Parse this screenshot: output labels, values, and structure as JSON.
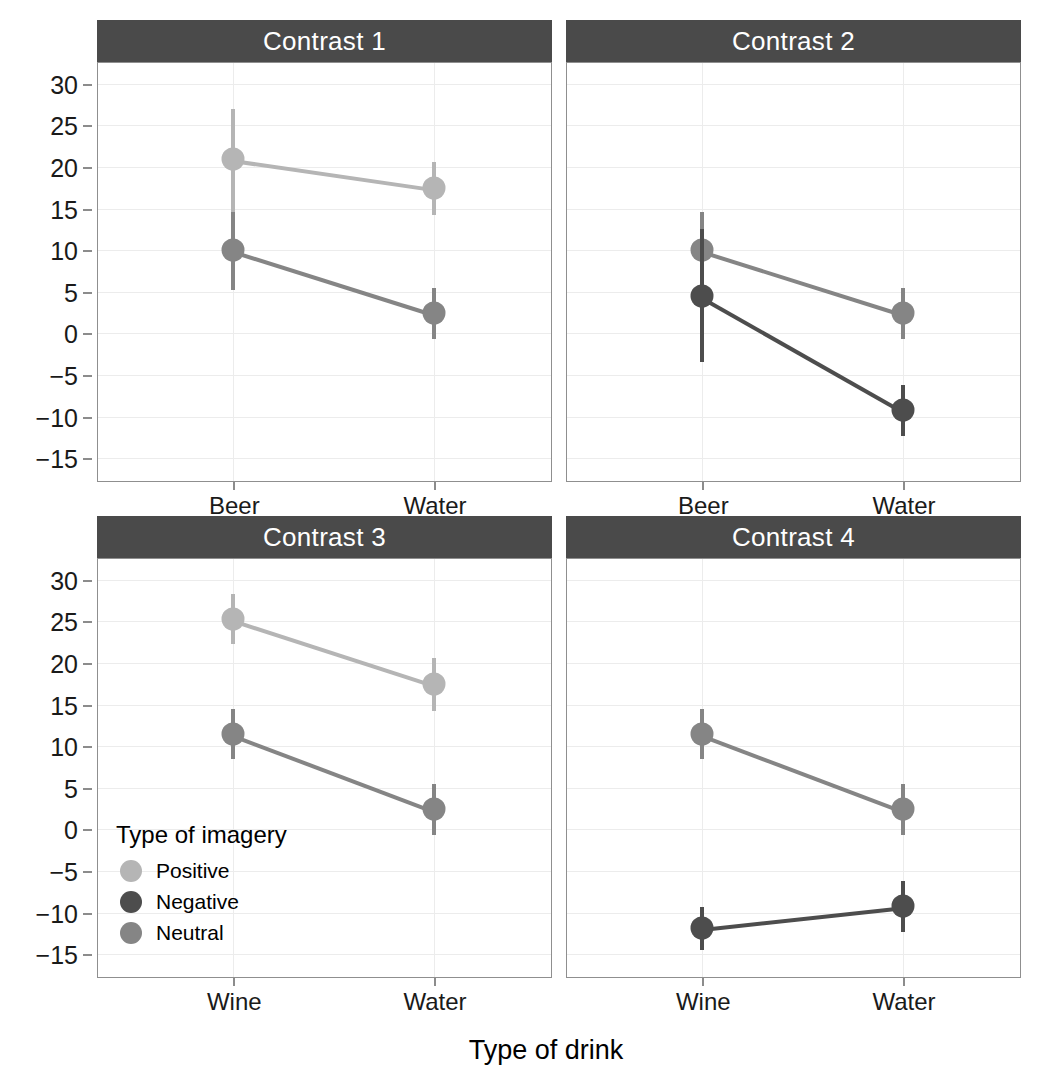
{
  "chart_data": {
    "type": "line",
    "title": "",
    "xlabel": "Type of drink",
    "ylabel": "Mean attitude rating",
    "ylim": [
      -17.5,
      32.5
    ],
    "yticks": [
      30,
      25,
      20,
      15,
      10,
      5,
      0,
      -5,
      -10,
      -15
    ],
    "ytick_labels": [
      "30",
      "25",
      "20",
      "15",
      "10",
      "5",
      "0",
      "−5",
      "−10",
      "−15"
    ],
    "grid": true,
    "legend_position": "inside-panel-contrast-3-bottom-left",
    "legend_title": "Type of imagery",
    "error_bars": "95% confidence interval",
    "series_colors": {
      "Positive": "#b5b5b5",
      "Negative": "#4d4d4d",
      "Neutral": "#858585"
    },
    "facets": [
      {
        "label": "Contrast 1",
        "categories": [
          "Beer",
          "Water"
        ],
        "series": [
          {
            "name": "Positive",
            "values": [
              21.0,
              17.5
            ],
            "ci_low": [
              5.3,
              14.2
            ],
            "ci_high": [
              27.0,
              20.6
            ]
          },
          {
            "name": "Neutral",
            "values": [
              10.0,
              2.4
            ],
            "ci_low": [
              5.2,
              -0.7
            ],
            "ci_high": [
              14.6,
              5.4
            ]
          }
        ]
      },
      {
        "label": "Contrast 2",
        "categories": [
          "Beer",
          "Water"
        ],
        "series": [
          {
            "name": "Neutral",
            "values": [
              10.0,
              2.4
            ],
            "ci_low": [
              5.2,
              -0.7
            ],
            "ci_high": [
              14.6,
              5.4
            ]
          },
          {
            "name": "Negative",
            "values": [
              4.5,
              -9.2
            ],
            "ci_low": [
              -3.4,
              -12.3
            ],
            "ci_high": [
              12.5,
              -6.2
            ]
          }
        ]
      },
      {
        "label": "Contrast 3",
        "categories": [
          "Wine",
          "Water"
        ],
        "series": [
          {
            "name": "Positive",
            "values": [
              25.3,
              17.5
            ],
            "ci_low": [
              22.3,
              14.2
            ],
            "ci_high": [
              28.3,
              20.6
            ]
          },
          {
            "name": "Neutral",
            "values": [
              11.5,
              2.4
            ],
            "ci_low": [
              8.5,
              -0.7
            ],
            "ci_high": [
              14.5,
              5.4
            ]
          }
        ]
      },
      {
        "label": "Contrast 4",
        "categories": [
          "Wine",
          "Water"
        ],
        "series": [
          {
            "name": "Neutral",
            "values": [
              11.5,
              2.4
            ],
            "ci_low": [
              8.5,
              -0.7
            ],
            "ci_high": [
              14.5,
              5.4
            ]
          },
          {
            "name": "Negative",
            "values": [
              -11.8,
              -9.2
            ],
            "ci_low": [
              -14.5,
              -12.3
            ],
            "ci_high": [
              -9.3,
              -6.2
            ]
          }
        ]
      }
    ],
    "legend_entries": [
      {
        "label": "Positive",
        "color": "#b5b5b5"
      },
      {
        "label": "Negative",
        "color": "#4d4d4d"
      },
      {
        "label": "Neutral",
        "color": "#858585"
      }
    ]
  }
}
